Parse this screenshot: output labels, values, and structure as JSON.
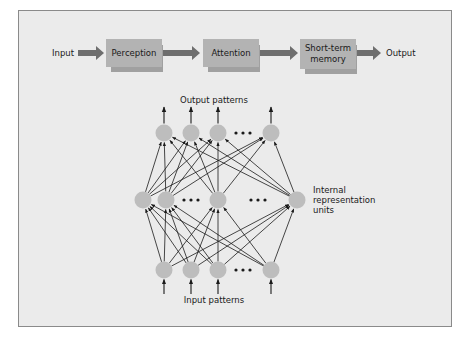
{
  "pipeline": {
    "input_label": "Input",
    "output_label": "Output",
    "stages": [
      {
        "label": "Perception",
        "lines": [
          "Perception"
        ]
      },
      {
        "label": "Attention",
        "lines": [
          "Attention"
        ]
      },
      {
        "label": "Short-term memory",
        "lines": [
          "Short-term",
          "memory"
        ]
      }
    ],
    "colors": {
      "box": "#b3b3b3",
      "box_shadow": "#a0a0a0",
      "arrow": "#6e6e6e"
    }
  },
  "network": {
    "output_label": "Output patterns",
    "input_label": "Input patterns",
    "hidden_label": [
      "Internal",
      "representation",
      "units"
    ],
    "ellipsis": "• • •",
    "layers": {
      "output": {
        "y": 133,
        "nodes": [
          164,
          191,
          218,
          271
        ],
        "ellipsis_x": 243
      },
      "hidden": {
        "y": 200,
        "nodes": [
          143,
          166,
          218,
          297
        ],
        "ellipsis_x": [
          191,
          258
        ]
      },
      "input": {
        "y": 270,
        "nodes": [
          164,
          191,
          218,
          271
        ],
        "ellipsis_x": [
          243
        ]
      }
    },
    "colors": {
      "node": "#bdbdbd",
      "edge": "#1a1a1a"
    }
  }
}
